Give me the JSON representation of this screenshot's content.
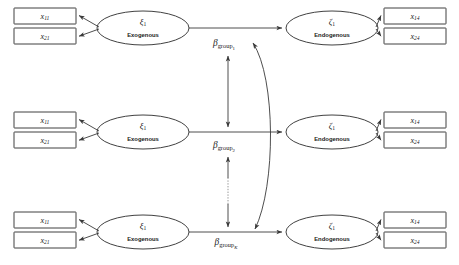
{
  "diagram": {
    "type": "path-diagram",
    "colors": {
      "stroke": "#2b2b2b",
      "edge": "#3a3a3a",
      "background": "#ffffff",
      "text": "#1a1a1a"
    },
    "rows": [
      {
        "id": "group-1",
        "left_indicators": [
          {
            "symbol": "x",
            "sub": "11"
          },
          {
            "symbol": "x",
            "sub": "21"
          }
        ],
        "exogenous": {
          "symbol": "ξ",
          "sub": "1",
          "role": "Exogenous"
        },
        "endogenous": {
          "symbol": "ζ",
          "sub": "1",
          "role": "Endogenous"
        },
        "right_indicators": [
          {
            "symbol": "x",
            "sub": "14"
          },
          {
            "symbol": "x",
            "sub": "24"
          }
        ],
        "path_label": {
          "symbol": "β",
          "sub": "group",
          "subsub": "1",
          "subsub_italic": false
        }
      },
      {
        "id": "group-2",
        "left_indicators": [
          {
            "symbol": "x",
            "sub": "11"
          },
          {
            "symbol": "x",
            "sub": "21"
          }
        ],
        "exogenous": {
          "symbol": "ξ",
          "sub": "1",
          "role": "Exogenous"
        },
        "endogenous": {
          "symbol": "ζ",
          "sub": "1",
          "role": "Endogenous"
        },
        "right_indicators": [
          {
            "symbol": "x",
            "sub": "14"
          },
          {
            "symbol": "x",
            "sub": "24"
          }
        ],
        "path_label": {
          "symbol": "β",
          "sub": "group",
          "subsub": "2",
          "subsub_italic": false
        }
      },
      {
        "id": "group-K",
        "left_indicators": [
          {
            "symbol": "x",
            "sub": "11"
          },
          {
            "symbol": "x",
            "sub": "21"
          }
        ],
        "exogenous": {
          "symbol": "ξ",
          "sub": "1",
          "role": "Exogenous"
        },
        "endogenous": {
          "symbol": "ζ",
          "sub": "1",
          "role": "Endogenous"
        },
        "right_indicators": [
          {
            "symbol": "x",
            "sub": "14"
          },
          {
            "symbol": "x",
            "sub": "24"
          }
        ],
        "path_label": {
          "symbol": "β",
          "sub": "group",
          "subsub": "K",
          "subsub_italic": true
        }
      }
    ],
    "connectors": {
      "vertical_top": {
        "style": "solid",
        "arrowheads": "both"
      },
      "vertical_bottom": {
        "style": "dotted-gap",
        "arrowheads": "both"
      },
      "arc": {
        "style": "curved",
        "arrowheads": "both"
      }
    }
  }
}
